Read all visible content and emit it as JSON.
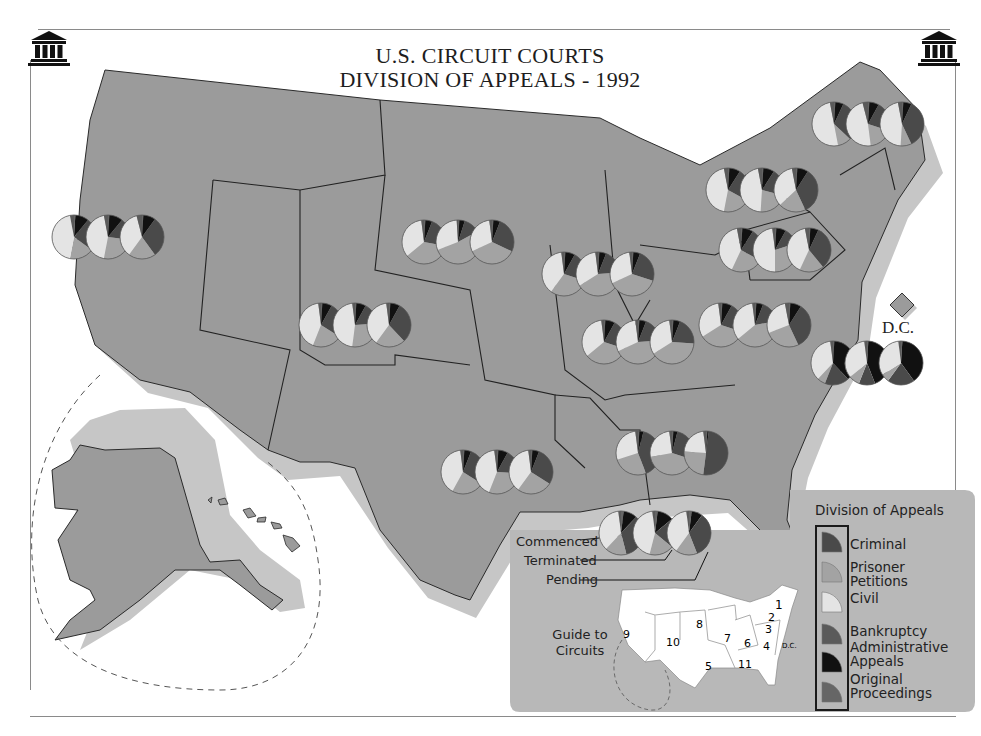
{
  "header": {
    "title_line1": "U.S. CIRCUIT COURTS",
    "title_line2": "DIVISION OF APPEALS - 1992",
    "left_icon": "courthouse-icon",
    "right_icon": "courthouse-icon"
  },
  "colors": {
    "land": "#9a9a9a",
    "land_shadow": "#c4c4c4",
    "background": "#ffffff",
    "criminal": "#4a4a4a",
    "prisoner_petitions": "#a3a3a3",
    "civil": "#e4e4e4",
    "bankruptcy": "#5a5a5a",
    "administrative_appeals": "#111111",
    "original_proceedings": "#666666",
    "legend_panel": "#b8b8b8"
  },
  "legend": {
    "title": "Division of Appeals",
    "items": [
      {
        "key": "criminal",
        "label": "Criminal"
      },
      {
        "key": "prisoner_petitions",
        "label": "Prisoner Petitions"
      },
      {
        "key": "civil",
        "label": "Civil"
      },
      {
        "key": "bankruptcy",
        "label": "Bankruptcy"
      },
      {
        "key": "administrative_appeals",
        "label": "Administrative Appeals"
      },
      {
        "key": "original_proceedings",
        "label": "Original Proceedings"
      }
    ]
  },
  "example_pointer": {
    "commenced": "Commenced",
    "terminated": "Terminated",
    "pending": "Pending"
  },
  "guide": {
    "label": "Guide to Circuits",
    "circuits": [
      "1",
      "2",
      "3",
      "4",
      "5",
      "6",
      "7",
      "8",
      "9",
      "10",
      "11",
      "D.C."
    ]
  },
  "dc_label": "D.C.",
  "chart_data": {
    "type": "pie",
    "title": "U.S. Circuit Courts Division of Appeals - 1992",
    "note": "Each circuit shows three pies: Commenced, Terminated, Pending. Values are estimated percentage shares read from slice angles; categories in order [Criminal, Prisoner Petitions, Civil, Bankruptcy, Administrative Appeals, Original Proceedings].",
    "categories": [
      "Criminal",
      "Prisoner Petitions",
      "Civil",
      "Bankruptcy",
      "Administrative Appeals",
      "Original Proceedings"
    ],
    "pie_order": [
      "Commenced",
      "Terminated",
      "Pending"
    ],
    "circuits": [
      {
        "circuit": "1",
        "x": 868,
        "y": 124,
        "pies": [
          [
            30,
            10,
            50,
            3,
            6,
            1
          ],
          [
            22,
            18,
            48,
            4,
            7,
            1
          ],
          [
            36,
            8,
            46,
            3,
            6,
            1
          ]
        ]
      },
      {
        "circuit": "2",
        "x": 762,
        "y": 190,
        "pies": [
          [
            24,
            20,
            44,
            3,
            8,
            1
          ],
          [
            20,
            22,
            46,
            3,
            8,
            1
          ],
          [
            34,
            20,
            34,
            3,
            8,
            1
          ]
        ]
      },
      {
        "circuit": "3",
        "x": 775,
        "y": 250,
        "pies": [
          [
            24,
            24,
            40,
            3,
            8,
            1
          ],
          [
            12,
            30,
            48,
            2,
            7,
            1
          ],
          [
            32,
            18,
            40,
            3,
            6,
            1
          ]
        ]
      },
      {
        "circuit": "4",
        "x": 755,
        "y": 325,
        "pies": [
          [
            22,
            36,
            32,
            2,
            7,
            1
          ],
          [
            16,
            42,
            34,
            2,
            5,
            1
          ],
          [
            34,
            26,
            28,
            3,
            8,
            1
          ]
        ]
      },
      {
        "circuit": "5",
        "x": 497,
        "y": 472,
        "pies": [
          [
            28,
            24,
            40,
            2,
            5,
            1
          ],
          [
            18,
            30,
            42,
            2,
            7,
            1
          ],
          [
            28,
            26,
            38,
            2,
            5,
            1
          ]
        ]
      },
      {
        "circuit": "6",
        "x": 638,
        "y": 342,
        "pies": [
          [
            22,
            34,
            34,
            2,
            7,
            1
          ],
          [
            18,
            44,
            30,
            2,
            5,
            1
          ],
          [
            20,
            40,
            32,
            2,
            5,
            1
          ]
        ]
      },
      {
        "circuit": "7",
        "x": 598,
        "y": 274,
        "pies": [
          [
            22,
            30,
            38,
            2,
            7,
            1
          ],
          [
            18,
            42,
            32,
            2,
            5,
            1
          ],
          [
            24,
            38,
            30,
            2,
            5,
            1
          ]
        ]
      },
      {
        "circuit": "8",
        "x": 458,
        "y": 242,
        "pies": [
          [
            22,
            36,
            34,
            2,
            5,
            1
          ],
          [
            12,
            52,
            30,
            1,
            4,
            1
          ],
          [
            26,
            36,
            30,
            2,
            5,
            1
          ]
        ]
      },
      {
        "circuit": "9",
        "x": 108,
        "y": 237,
        "pies": [
          [
            24,
            18,
            44,
            3,
            10,
            1
          ],
          [
            16,
            26,
            44,
            3,
            10,
            1
          ],
          [
            30,
            20,
            36,
            4,
            9,
            1
          ]
        ]
      },
      {
        "circuit": "10",
        "x": 355,
        "y": 325,
        "pies": [
          [
            26,
            22,
            42,
            2,
            7,
            1
          ],
          [
            16,
            28,
            46,
            2,
            7,
            1
          ],
          [
            30,
            22,
            38,
            2,
            7,
            1
          ]
        ]
      },
      {
        "circuit": "11",
        "x": 672,
        "y": 453,
        "pies": [
          [
            40,
            26,
            28,
            2,
            3,
            1
          ],
          [
            26,
            42,
            26,
            2,
            3,
            1
          ],
          [
            50,
            24,
            22,
            2,
            1,
            1
          ]
        ]
      },
      {
        "circuit": "D.C.",
        "x": 867,
        "y": 363,
        "pies": [
          [
            18,
            6,
            36,
            2,
            37,
            1
          ],
          [
            12,
            8,
            34,
            2,
            43,
            1
          ],
          [
            20,
            6,
            32,
            2,
            39,
            1
          ]
        ]
      },
      {
        "circuit": "Example (5th)",
        "x": 655,
        "y": 533,
        "pies": [
          [
            34,
            16,
            36,
            2,
            10,
            2
          ],
          [
            22,
            18,
            44,
            2,
            12,
            2
          ],
          [
            34,
            16,
            38,
            2,
            8,
            2
          ]
        ]
      }
    ]
  }
}
